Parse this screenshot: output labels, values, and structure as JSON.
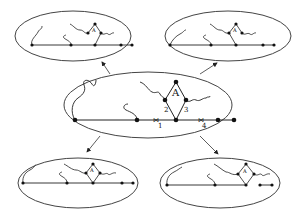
{
  "diagram": {
    "colors": {
      "stroke": "#333333",
      "node": "#111111",
      "background": "#ffffff"
    },
    "center": {
      "label_A": "A",
      "edge_labels": [
        "1",
        "2",
        "3",
        "4"
      ]
    },
    "top_left": {
      "label_A": "A"
    },
    "top_right": {
      "label_A": "A"
    },
    "bottom_left": {
      "label_A": "A"
    },
    "bottom_right": {
      "label_A": "A"
    }
  }
}
